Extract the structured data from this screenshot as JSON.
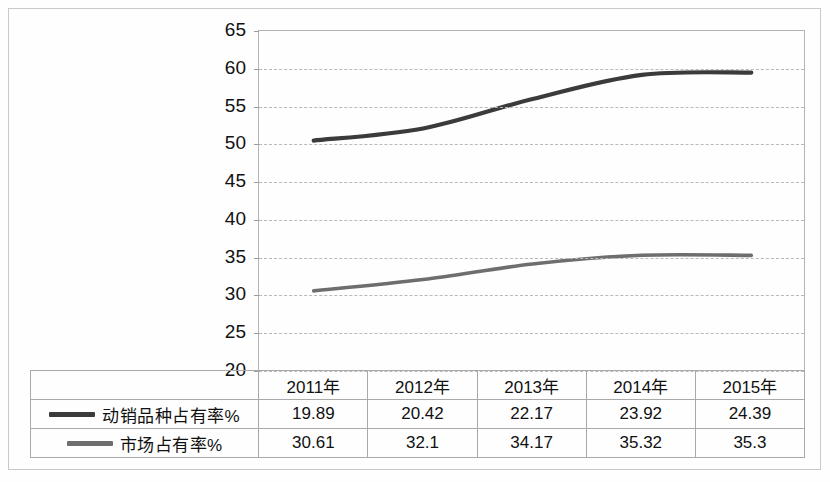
{
  "chart_data": {
    "type": "line",
    "title": "",
    "xlabel": "",
    "ylabel": "",
    "ylim": [
      20,
      65
    ],
    "ytick_step": 5,
    "yticks": [
      65,
      60,
      55,
      50,
      45,
      40,
      35,
      30,
      25,
      20
    ],
    "grid": true,
    "legend_position": "table-left",
    "categories": [
      "2011年",
      "2012年",
      "2013年",
      "2014年",
      "2015年"
    ],
    "series": [
      {
        "name": "动销品种占有率%",
        "color": "#3b3b3b",
        "table_values": [
          19.89,
          20.42,
          22.17,
          23.92,
          24.39
        ],
        "plotted_values": [
          50.5,
          52.1,
          56.0,
          59.2,
          59.5
        ]
      },
      {
        "name": "市场占有率%",
        "color": "#6e6e6e",
        "table_values": [
          30.61,
          32.1,
          34.17,
          35.32,
          35.3
        ],
        "plotted_values": [
          30.61,
          32.1,
          34.17,
          35.32,
          35.3
        ]
      }
    ]
  },
  "table": {
    "corner_label": "",
    "headers": [
      "2011年",
      "2012年",
      "2013年",
      "2014年",
      "2015年"
    ],
    "rows": [
      {
        "label": "动销品种占有率%",
        "swatch_color": "#3b3b3b",
        "cells": [
          "19.89",
          "20.42",
          "22.17",
          "23.92",
          "24.39"
        ]
      },
      {
        "label": "市场占有率%",
        "swatch_color": "#6e6e6e",
        "cells": [
          "30.61",
          "32.1",
          "34.17",
          "35.32",
          "35.3"
        ]
      }
    ]
  },
  "axis": {
    "tick_65": "65",
    "tick_60": "60",
    "tick_55": "55",
    "tick_50": "50",
    "tick_45": "45",
    "tick_40": "40",
    "tick_35": "35",
    "tick_30": "30",
    "tick_25": "25",
    "tick_20": "20"
  }
}
